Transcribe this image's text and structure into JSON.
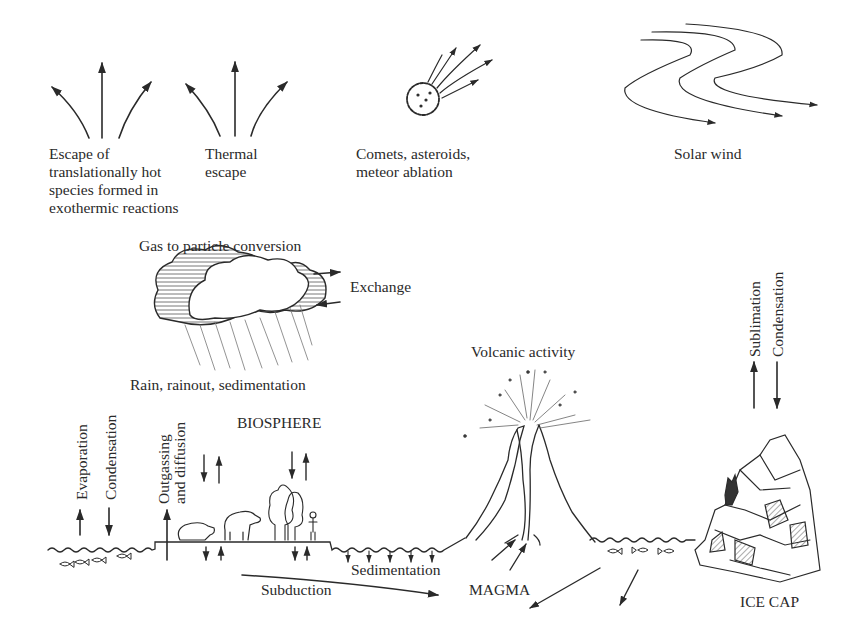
{
  "diagram": {
    "top_processes": [
      {
        "id": "escape-hot",
        "label_lines": [
          "Escape of",
          "translationally hot",
          "species formed in",
          "exothermic reactions"
        ]
      },
      {
        "id": "thermal-escape",
        "label_lines": [
          "Thermal",
          "escape"
        ]
      },
      {
        "id": "comets",
        "label_lines": [
          "Comets, asteroids,",
          "meteor ablation"
        ]
      },
      {
        "id": "solar-wind",
        "label_lines": [
          "Solar wind"
        ]
      }
    ],
    "cloud": {
      "top_label": "Gas to particle conversion",
      "exchange_label": "Exchange",
      "bottom_label": "Rain, rainout, sedimentation"
    },
    "surface_labels": {
      "evaporation": "Evaporation",
      "condensation_left": "Condensation",
      "outgassing_1": "Outgassing",
      "outgassing_2": "and diffusion",
      "biosphere": "BIOSPHERE",
      "volcanic": "Volcanic activity",
      "sublimation": "Sublimation",
      "condensation_right": "Condensation",
      "sedimentation": "Sedimentation",
      "subduction": "Subduction",
      "magma": "MAGMA",
      "ice_cap": "ICE CAP"
    },
    "colors": {
      "ink": "#2a2a2a",
      "background": "#ffffff"
    }
  }
}
